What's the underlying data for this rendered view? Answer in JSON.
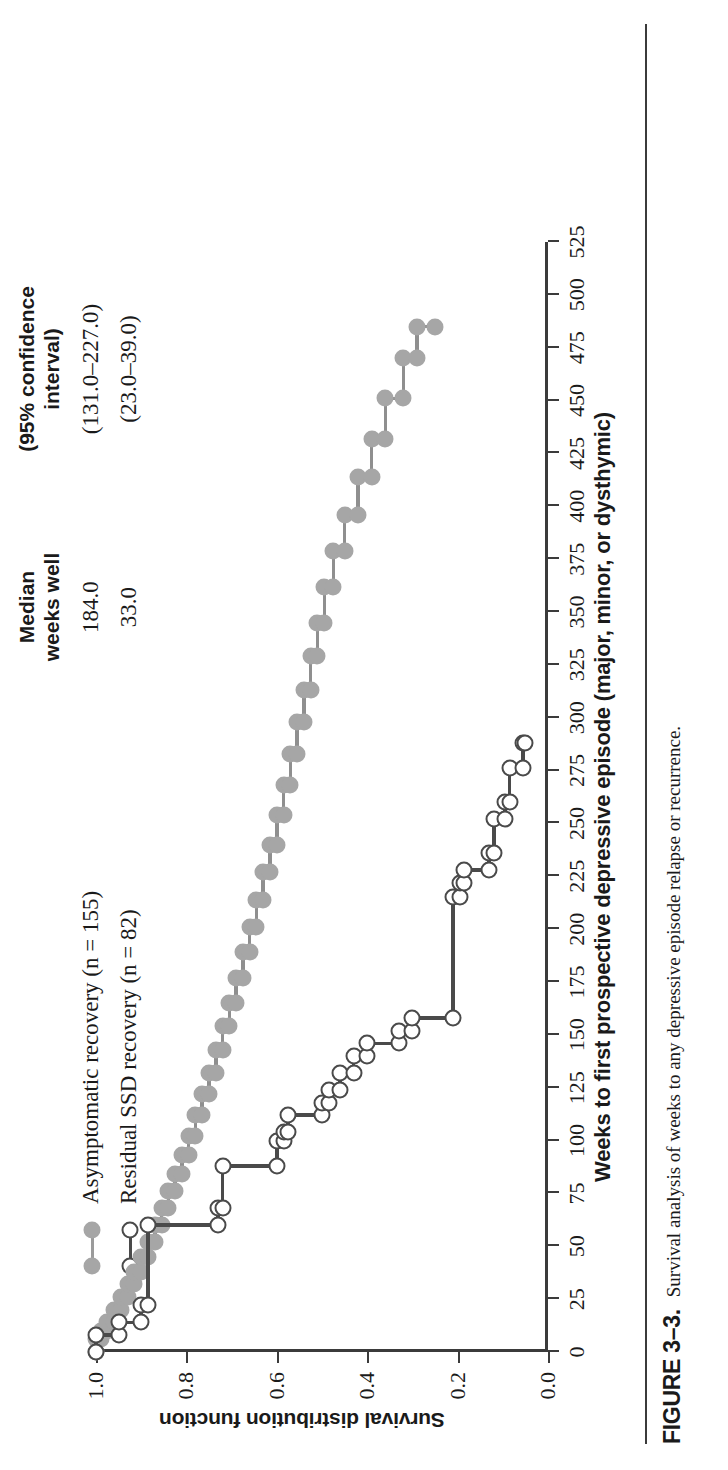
{
  "figure": {
    "label": "FIGURE 3–3.",
    "caption": "Survival analysis of weeks to any depressive episode relapse or recurrence."
  },
  "legend": {
    "headers": {
      "median_line1": "Median",
      "median_line2": "weeks well",
      "ci_line1": "(95% confidence",
      "ci_line2": "interval)"
    },
    "rows": [
      {
        "label": "Asymptomatic recovery (n = 155)",
        "marker": "filled-gray-circle",
        "median_weeks_well": "184.0",
        "confidence_interval": "(131.0–227.0)"
      },
      {
        "label": "Residual SSD recovery (n = 82)",
        "marker": "open-circle",
        "median_weeks_well": "33.0",
        "confidence_interval": "(23.0–39.0)"
      }
    ]
  },
  "chart_data": {
    "type": "line",
    "title": "",
    "xlabel": "Weeks to first prospective depressive episode (major, minor, or dysthymic)",
    "ylabel": "Survival distribution function",
    "xlim": [
      0,
      525
    ],
    "ylim": [
      0.0,
      1.0
    ],
    "xticks": [
      0,
      25,
      50,
      75,
      100,
      125,
      150,
      175,
      200,
      225,
      250,
      275,
      300,
      325,
      350,
      375,
      400,
      425,
      450,
      475,
      500,
      525
    ],
    "yticks": [
      0.0,
      0.2,
      0.4,
      0.6,
      0.8,
      1.0
    ],
    "ytick_labels": [
      "0.0",
      "0.2",
      "0.4",
      "0.6",
      "0.8",
      "1.0"
    ],
    "grid": false,
    "legend_position": "above-plot",
    "series": [
      {
        "name": "Asymptomatic recovery (n = 155)",
        "marker": "filled-gray-circle",
        "color": "#a6a6a6",
        "step": "post",
        "points": [
          [
            0,
            1.0
          ],
          [
            6,
            0.99
          ],
          [
            10,
            0.975
          ],
          [
            14,
            0.96
          ],
          [
            20,
            0.945
          ],
          [
            26,
            0.93
          ],
          [
            32,
            0.915
          ],
          [
            38,
            0.9
          ],
          [
            45,
            0.885
          ],
          [
            52,
            0.87
          ],
          [
            60,
            0.855
          ],
          [
            68,
            0.84
          ],
          [
            76,
            0.825
          ],
          [
            84,
            0.81
          ],
          [
            93,
            0.795
          ],
          [
            102,
            0.78
          ],
          [
            112,
            0.765
          ],
          [
            122,
            0.75
          ],
          [
            132,
            0.735
          ],
          [
            143,
            0.72
          ],
          [
            154,
            0.705
          ],
          [
            165,
            0.69
          ],
          [
            177,
            0.675
          ],
          [
            189,
            0.66
          ],
          [
            201,
            0.645
          ],
          [
            214,
            0.63
          ],
          [
            227,
            0.615
          ],
          [
            240,
            0.6
          ],
          [
            254,
            0.585
          ],
          [
            268,
            0.57
          ],
          [
            283,
            0.555
          ],
          [
            298,
            0.54
          ],
          [
            313,
            0.525
          ],
          [
            329,
            0.51
          ],
          [
            345,
            0.495
          ],
          [
            362,
            0.475
          ],
          [
            379,
            0.45
          ],
          [
            396,
            0.42
          ],
          [
            414,
            0.39
          ],
          [
            432,
            0.36
          ],
          [
            451,
            0.32
          ],
          [
            470,
            0.29
          ],
          [
            485,
            0.25
          ]
        ]
      },
      {
        "name": "Residual SSD recovery (n = 82)",
        "marker": "open-circle",
        "color": "#4a4a4a",
        "step": "post",
        "points": [
          [
            0,
            1.0
          ],
          [
            8,
            0.95
          ],
          [
            14,
            0.9
          ],
          [
            22,
            0.885
          ],
          [
            60,
            0.73
          ],
          [
            68,
            0.72
          ],
          [
            88,
            0.6
          ],
          [
            100,
            0.585
          ],
          [
            104,
            0.575
          ],
          [
            112,
            0.5
          ],
          [
            118,
            0.485
          ],
          [
            124,
            0.46
          ],
          [
            132,
            0.43
          ],
          [
            140,
            0.4
          ],
          [
            146,
            0.33
          ],
          [
            152,
            0.3
          ],
          [
            158,
            0.21
          ],
          [
            215,
            0.195
          ],
          [
            222,
            0.185
          ],
          [
            228,
            0.13
          ],
          [
            236,
            0.12
          ],
          [
            252,
            0.095
          ],
          [
            260,
            0.085
          ],
          [
            276,
            0.055
          ],
          [
            288,
            0.05
          ]
        ]
      }
    ]
  }
}
